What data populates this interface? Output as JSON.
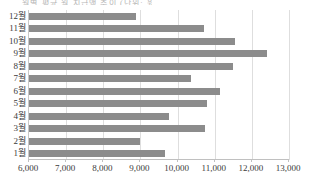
{
  "caption": {
    "text": "월별 평균 월 지급액 추이 (단위: 원)"
  },
  "colors": {
    "bar": "#8c8c8c",
    "grid": "#dedede",
    "axis": "#c0c0c0",
    "text": "#3a3a3a"
  },
  "chart_data": {
    "type": "bar",
    "orientation": "horizontal",
    "title": "",
    "xlabel": "",
    "ylabel": "",
    "categories": [
      "12월",
      "11월",
      "10월",
      "9월",
      "8월",
      "7월",
      "6월",
      "5월",
      "4월",
      "3월",
      "2월",
      "1월"
    ],
    "values": [
      8870,
      10700,
      11550,
      12420,
      11500,
      10350,
      11130,
      10790,
      9760,
      10750,
      8990,
      9670
    ],
    "xlim": [
      6000,
      13000
    ],
    "xticks": [
      6000,
      7000,
      8000,
      9000,
      10000,
      11000,
      12000,
      13000
    ],
    "xticklabels": [
      "6,000",
      "7,000",
      "8,000",
      "9,000",
      "10,000",
      "11,000",
      "12,000",
      "13,000"
    ],
    "grid": true,
    "grid_axis": "x",
    "legend": false,
    "series": [
      {
        "name": "월별 값",
        "values": [
          8870,
          10700,
          11550,
          12420,
          11500,
          10350,
          11130,
          10790,
          9760,
          10750,
          8990,
          9670
        ]
      }
    ]
  }
}
